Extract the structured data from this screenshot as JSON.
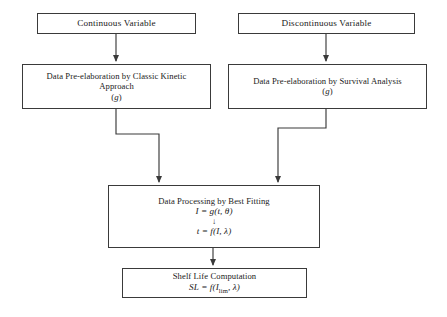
{
  "diagram": {
    "background_color": "#ffffff",
    "line_color": "#3a3a3a"
  },
  "nodes": {
    "continuous": {
      "label": "Continuous Variable"
    },
    "discontinuous": {
      "label": "Discontinuous Variable"
    },
    "kinetic": {
      "line1": "Data Pre-elaboration by Classic Kinetic",
      "line2": "Approach",
      "line3_open": "(",
      "line3_var": "g",
      "line3_close": ")"
    },
    "survival": {
      "line1": "Data Pre-elaboration by Survival Analysis",
      "line2_open": "(",
      "line2_var": "g",
      "line2_close": ")"
    },
    "processing": {
      "title": "Data Processing by Best Fitting",
      "formula1": "I = g(t, θ)",
      "inner_arrow": "↓",
      "formula2": "t = f(I, λ)"
    },
    "shelflife": {
      "title": "Shelf Life Computation",
      "formula_lead": "SL = f(I",
      "formula_sub": "lim",
      "formula_tail": ", λ)"
    }
  },
  "edges": [
    {
      "name": "continuous-to-kinetic",
      "from": "continuous",
      "to": "kinetic",
      "style": "straight-down"
    },
    {
      "name": "discontinuous-to-survival",
      "from": "discontinuous",
      "to": "survival",
      "style": "straight-down"
    },
    {
      "name": "kinetic-to-processing",
      "from": "kinetic",
      "to": "processing",
      "style": "elbow-right"
    },
    {
      "name": "survival-to-processing",
      "from": "survival",
      "to": "processing",
      "style": "elbow-left"
    },
    {
      "name": "processing-to-shelflife",
      "from": "processing",
      "to": "shelflife",
      "style": "straight-down"
    }
  ]
}
